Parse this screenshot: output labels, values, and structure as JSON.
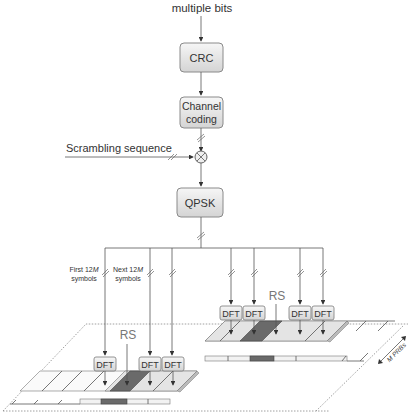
{
  "diagram": {
    "input_label": "multiple bits",
    "blocks": [
      {
        "id": "crc",
        "label": "CRC"
      },
      {
        "id": "channel_coding",
        "label_line1": "Channel",
        "label_line2": "coding"
      },
      {
        "id": "qpsk",
        "label": "QPSK"
      }
    ],
    "scrambling_label": "Scrambling sequence",
    "mixer_symbol": "⊗",
    "split_labels": {
      "first": {
        "line1": "First 12",
        "italic": "M",
        "line2": "symbols"
      },
      "next": {
        "line1": "Next 12",
        "italic": "M",
        "line2": "symbols"
      }
    },
    "dft_label": "DFT",
    "rs_label": "RS",
    "bandwidth_label": "M PRBs",
    "dft_count_left": 3,
    "dft_count_right": 4,
    "colors": {
      "box_fill_top": "#f4f4f4",
      "box_fill_bottom": "#d6d6d6",
      "rs_fill": "#6a6a6a",
      "slot_fill": "#e6e6e6",
      "line": "#555555"
    }
  }
}
